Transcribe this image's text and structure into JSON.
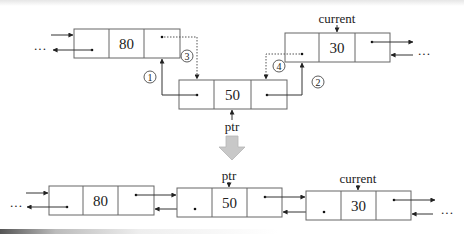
{
  "before": {
    "nodes": [
      {
        "id": "n80",
        "value": "80",
        "x": 74,
        "y": 29,
        "w": 106,
        "h": 29
      },
      {
        "id": "n50",
        "value": "50",
        "x": 179,
        "y": 80,
        "w": 108,
        "h": 29
      },
      {
        "id": "n30",
        "value": "30",
        "x": 285,
        "y": 33,
        "w": 105,
        "h": 29
      }
    ],
    "labels": {
      "current": "current",
      "ptr": "ptr"
    },
    "steps": [
      "①",
      "②",
      "③",
      "④"
    ],
    "ellipsis_left": "···",
    "ellipsis_right": "···"
  },
  "after": {
    "nodes": [
      {
        "id": "m80",
        "value": "80",
        "x": 49,
        "y": 186,
        "w": 105,
        "h": 29
      },
      {
        "id": "m50",
        "value": "50",
        "x": 177,
        "y": 188,
        "w": 105,
        "h": 29
      },
      {
        "id": "m30",
        "value": "30",
        "x": 306,
        "y": 191,
        "w": 105,
        "h": 29
      }
    ],
    "labels": {
      "current": "current",
      "ptr": "ptr"
    },
    "ellipsis_left": "···",
    "ellipsis_right": "···"
  },
  "transition_arrow_color": "#c8c8c8"
}
